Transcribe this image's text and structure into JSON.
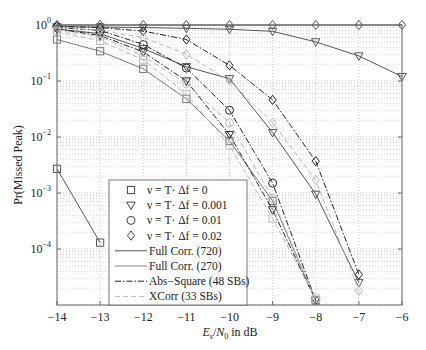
{
  "chart_data": {
    "type": "line",
    "title": "",
    "xlabel": "E_s/N_0 in dB",
    "ylabel": "Pr(Missed Peak)",
    "xlim": [
      -14,
      -6
    ],
    "ylim": [
      1e-05,
      1
    ],
    "yscale": "log",
    "grid": true,
    "legend_position": "lower-left-center",
    "x_ticks": [
      -14,
      -13,
      -12,
      -11,
      -10,
      -9,
      -8,
      -7,
      -6
    ],
    "x_tick_labels": [
      "−14",
      "−13",
      "−12",
      "−11",
      "−10",
      "−9",
      "−8",
      "−7",
      "−6"
    ],
    "y_ticks": [
      1,
      0.1,
      0.01,
      0.001,
      0.0001
    ],
    "y_tick_labels": [
      {
        "base": "10",
        "exp": "0"
      },
      {
        "base": "10",
        "exp": "−1"
      },
      {
        "base": "10",
        "exp": "−2"
      },
      {
        "base": "10",
        "exp": "−3"
      },
      {
        "base": "10",
        "exp": "−4"
      }
    ],
    "legend": [
      {
        "label": "ν = T· Δf = 0",
        "marker": "square",
        "line": "none"
      },
      {
        "label": "ν = T· Δf = 0.001",
        "marker": "triangle-down",
        "line": "none"
      },
      {
        "label": "ν = T· Δf = 0.01",
        "marker": "circle",
        "line": "none"
      },
      {
        "label": "ν = T· Δf = 0.02",
        "marker": "diamond",
        "line": "none"
      },
      {
        "label": "Full Corr. (720)",
        "marker": "none",
        "line": "solid",
        "color": "#555555"
      },
      {
        "label": "Full Corr. (270)",
        "marker": "none",
        "line": "solid",
        "color": "#888888"
      },
      {
        "label": "Abs−Square (48 SBs)",
        "marker": "none",
        "line": "dashdot",
        "color": "#222222"
      },
      {
        "label": "XCorr (33 SBs)",
        "marker": "none",
        "line": "dashed",
        "color": "#bbbbbb"
      }
    ],
    "series": [
      {
        "name": "Full Corr. (720), Δf=0",
        "style": "solid",
        "color": "#555555",
        "marker": "square",
        "x": [
          -14,
          -13
        ],
        "values": [
          0.0027,
          0.00013
        ]
      },
      {
        "name": "Full Corr. (270), Δf=0",
        "style": "solid",
        "color": "#777777",
        "marker": "square",
        "x": [
          -14,
          -13,
          -12,
          -11,
          -10,
          -9,
          -8
        ],
        "values": [
          0.55,
          0.34,
          0.165,
          0.048,
          0.0085,
          0.00072,
          1.2e-05
        ]
      },
      {
        "name": "Full Corr. (270), Δf=0.001",
        "style": "solid",
        "color": "#555555",
        "marker": "triangle-down",
        "x": [
          -14,
          -13,
          -12,
          -11,
          -10,
          -9,
          -8,
          -7,
          -6
        ],
        "values": [
          0.93,
          0.92,
          0.9,
          0.87,
          0.84,
          0.77,
          0.5,
          0.28,
          0.12
        ]
      },
      {
        "name": "Full Corr. (720), Δf=0.001",
        "style": "solid",
        "color": "#555555",
        "marker": "triangle-down",
        "x": [
          -14,
          -13,
          -12,
          -11,
          -10,
          -9,
          -8,
          -7
        ],
        "values": [
          0.85,
          0.7,
          0.38,
          0.18,
          0.11,
          0.012,
          0.00095,
          2.5e-05
        ]
      },
      {
        "name": "Full Corr. (720), Δf=0.02",
        "style": "solid",
        "color": "#555555",
        "marker": "diamond",
        "x": [
          -14,
          -13,
          -12,
          -11,
          -10,
          -9,
          -8,
          -7,
          -6
        ],
        "values": [
          1.0,
          1.0,
          1.0,
          1.0,
          1.0,
          1.0,
          1.0,
          1.0,
          1.0
        ]
      },
      {
        "name": "Abs−Square (48 SBs), Δf=0.02",
        "style": "dashdot",
        "color": "#222222",
        "marker": "diamond",
        "x": [
          -14,
          -13,
          -12,
          -11,
          -10,
          -9,
          -8,
          -7
        ],
        "values": [
          0.95,
          0.9,
          0.78,
          0.55,
          0.19,
          0.046,
          0.0037,
          3.5e-05
        ]
      },
      {
        "name": "Abs−Square (48 SBs), Δf=0.01",
        "style": "dashdot",
        "color": "#222222",
        "marker": "circle",
        "x": [
          -14,
          -13,
          -12,
          -11,
          -10,
          -9,
          -8
        ],
        "values": [
          0.9,
          0.8,
          0.45,
          0.17,
          0.03,
          0.0015,
          1.2e-05
        ]
      },
      {
        "name": "Abs−Square (48 SBs), Δf=0.001",
        "style": "dashdot",
        "color": "#222222",
        "marker": "triangle-down",
        "x": [
          -14,
          -13,
          -12,
          -11,
          -10,
          -9,
          -8
        ],
        "values": [
          0.85,
          0.65,
          0.33,
          0.1,
          0.011,
          0.0005,
          1.2e-05
        ]
      },
      {
        "name": "XCorr (33 SBs), Δf=0.02",
        "style": "dashed",
        "color": "#bbbbbb",
        "marker": "diamond",
        "x": [
          -14,
          -13,
          -12,
          -11,
          -10,
          -9,
          -8,
          -7
        ],
        "values": [
          0.9,
          0.8,
          0.6,
          0.3,
          0.1,
          0.018,
          0.0017,
          1.8e-05
        ]
      },
      {
        "name": "XCorr (33 SBs), Δf=0.01",
        "style": "dashed",
        "color": "#bbbbbb",
        "marker": "circle",
        "x": [
          -14,
          -13,
          -12,
          -11,
          -10,
          -9,
          -8
        ],
        "values": [
          0.8,
          0.62,
          0.28,
          0.09,
          0.018,
          0.0008,
          1.2e-05
        ]
      },
      {
        "name": "XCorr (33 SBs), Δf=0",
        "style": "dashed",
        "color": "#bbbbbb",
        "marker": "square",
        "x": [
          -14,
          -13,
          -12,
          -11,
          -10,
          -9,
          -8
        ],
        "values": [
          0.75,
          0.52,
          0.24,
          0.058,
          0.007,
          0.00035,
          1.3e-05
        ]
      }
    ]
  }
}
